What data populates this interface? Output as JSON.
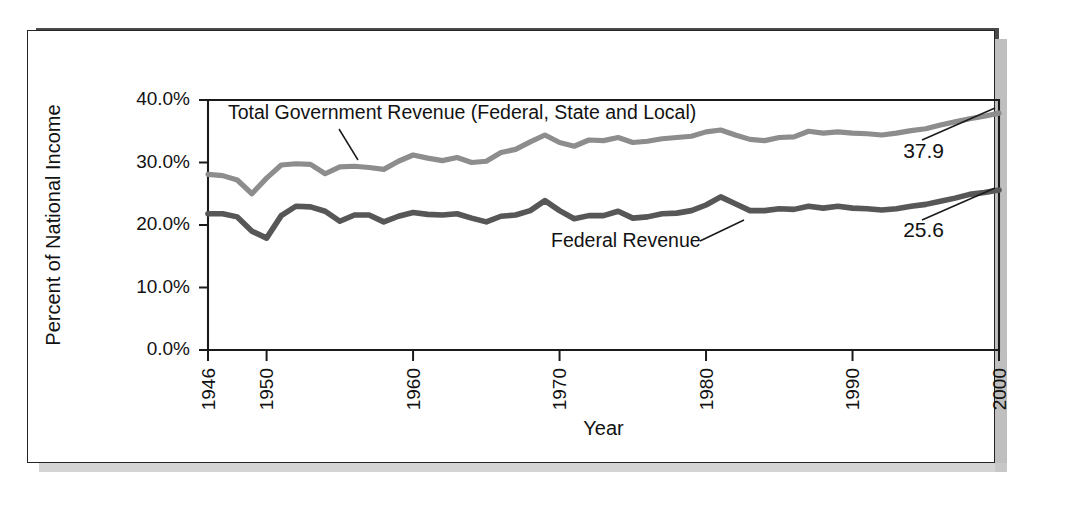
{
  "scan": {
    "top_cut_text": "",
    "figure_border_color": "#232323",
    "shadow_color": "#b4b4b4"
  },
  "chart_data": {
    "type": "line",
    "title": "",
    "xlabel": "Year",
    "ylabel": "Percent of National Income",
    "xlim": [
      1946,
      2000
    ],
    "ylim": [
      0,
      40
    ],
    "grid": false,
    "legend_position": "inline-annotations",
    "ytick_labels": [
      "0.0%",
      "10.0%",
      "20.0%",
      "30.0%",
      "40.0%"
    ],
    "ytick_values": [
      0,
      10,
      20,
      30,
      40
    ],
    "xtick_labels": [
      "1946",
      "1950",
      "1960",
      "1970",
      "1980",
      "1990",
      "2000"
    ],
    "xtick_values": [
      1946,
      1950,
      1960,
      1970,
      1980,
      1990,
      2000
    ],
    "x": [
      1946,
      1947,
      1948,
      1949,
      1950,
      1951,
      1952,
      1953,
      1954,
      1955,
      1956,
      1957,
      1958,
      1959,
      1960,
      1961,
      1962,
      1963,
      1964,
      1965,
      1966,
      1967,
      1968,
      1969,
      1970,
      1971,
      1972,
      1973,
      1974,
      1975,
      1976,
      1977,
      1978,
      1979,
      1980,
      1981,
      1982,
      1983,
      1984,
      1985,
      1986,
      1987,
      1988,
      1989,
      1990,
      1991,
      1992,
      1993,
      1994,
      1995,
      1996,
      1997,
      1998,
      1999,
      2000
    ],
    "series": [
      {
        "name": "Total Government Revenue (Federal, State and Local)",
        "color": "#8d8d8d",
        "end_label": "37.9",
        "values": [
          28.1,
          27.9,
          27.2,
          25.0,
          27.5,
          29.6,
          29.8,
          29.7,
          28.2,
          29.3,
          29.4,
          29.2,
          28.9,
          30.2,
          31.2,
          30.7,
          30.3,
          30.8,
          30.0,
          30.2,
          31.6,
          32.1,
          33.3,
          34.4,
          33.2,
          32.6,
          33.6,
          33.5,
          34.0,
          33.2,
          33.4,
          33.8,
          34.0,
          34.2,
          34.9,
          35.2,
          34.4,
          33.7,
          33.5,
          34.0,
          34.1,
          35.0,
          34.7,
          34.9,
          34.7,
          34.6,
          34.4,
          34.7,
          35.1,
          35.4,
          36.0,
          36.5,
          37.0,
          37.4,
          37.9
        ]
      },
      {
        "name": "Federal Revenue",
        "color": "#575757",
        "end_label": "25.6",
        "values": [
          21.8,
          21.8,
          21.3,
          19.0,
          17.9,
          21.5,
          23.0,
          22.9,
          22.2,
          20.6,
          21.6,
          21.6,
          20.5,
          21.4,
          22.0,
          21.7,
          21.6,
          21.8,
          21.1,
          20.5,
          21.4,
          21.6,
          22.3,
          23.9,
          22.3,
          21.0,
          21.5,
          21.5,
          22.2,
          21.1,
          21.3,
          21.8,
          21.9,
          22.3,
          23.2,
          24.5,
          23.4,
          22.3,
          22.3,
          22.6,
          22.5,
          23.0,
          22.7,
          23.0,
          22.7,
          22.6,
          22.4,
          22.6,
          23.0,
          23.3,
          23.8,
          24.3,
          24.9,
          25.2,
          25.6
        ]
      }
    ],
    "annotations": [
      {
        "text": "Total Government Revenue (Federal, State and Local)",
        "anchor_year": 1956
      },
      {
        "text": "Federal Revenue",
        "anchor_year": 1978
      }
    ]
  }
}
